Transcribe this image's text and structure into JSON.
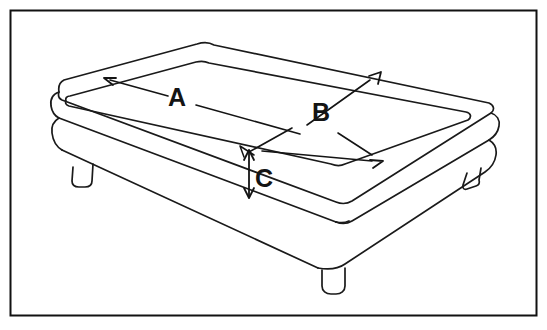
{
  "figure": {
    "view": "isometric-perspective",
    "background_color": "#ffffff",
    "line_color": "#1a1a1a",
    "label_color": "#141414"
  },
  "frame": {
    "name": "diagram-border",
    "color": "#111111",
    "stroke_width": 2,
    "x": 10,
    "y": 10,
    "width": 527,
    "height": 306
  },
  "labels": {
    "length": {
      "text": "A",
      "meaning": "length",
      "x": 177,
      "y": 99
    },
    "width": {
      "text": "B",
      "meaning": "width",
      "x": 321,
      "y": 114
    },
    "height": {
      "text": "C",
      "meaning": "height",
      "x": 264,
      "y": 180
    }
  },
  "dimension_lines": [
    {
      "name": "dimension-line-a",
      "label": "A",
      "orientation": "along-top-left-edge",
      "arrowheads": "single-start"
    },
    {
      "name": "dimension-line-b",
      "label": "B",
      "orientation": "diagonal-across-top",
      "arrowheads": "both-ends"
    },
    {
      "name": "dimension-line-c",
      "label": "C",
      "orientation": "vertical-side-thickness",
      "arrowheads": "both-ends"
    }
  ],
  "parts": [
    {
      "name": "mattress-top-surface"
    },
    {
      "name": "mattress-inner-panel"
    },
    {
      "name": "mattress-side-band"
    },
    {
      "name": "box-spring-band"
    },
    {
      "name": "leg-left"
    },
    {
      "name": "leg-front"
    },
    {
      "name": "leg-right"
    }
  ]
}
